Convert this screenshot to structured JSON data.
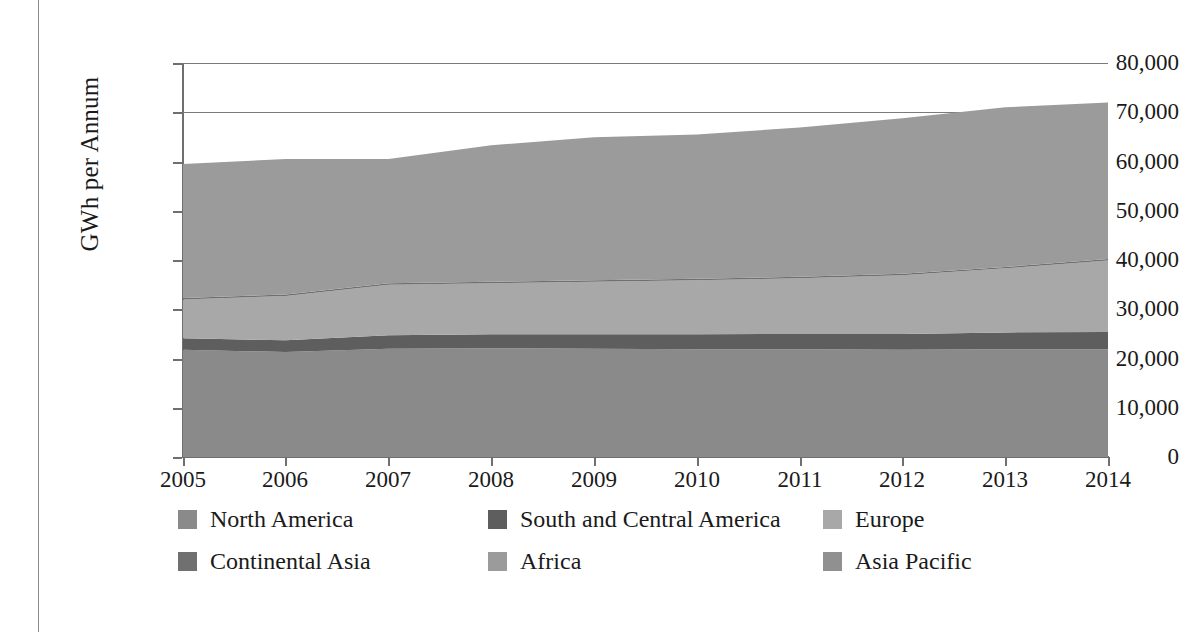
{
  "axes": {
    "y_title": "GWh per Annum",
    "y_ticks": [
      "80,000",
      "70,000",
      "60,000",
      "50,000",
      "40,000",
      "30,000",
      "20,000",
      "10,000",
      "0"
    ],
    "x_ticks": [
      "2005",
      "2006",
      "2007",
      "2008",
      "2009",
      "2010",
      "2011",
      "2012",
      "2013",
      "2014"
    ]
  },
  "legend": {
    "rows": [
      [
        {
          "label": "North America",
          "color": "#8a8a8a"
        },
        {
          "label": "South and Central America",
          "color": "#5e5e5e"
        },
        {
          "label": "Europe",
          "color": "#a8a8a8"
        }
      ],
      [
        {
          "label": "Continental Asia",
          "color": "#707070"
        },
        {
          "label": "Africa",
          "color": "#9b9b9b"
        },
        {
          "label": "Asia Pacific",
          "color": "#909090"
        }
      ]
    ]
  },
  "chart_data": {
    "type": "area",
    "title": "",
    "xlabel": "",
    "ylabel": "GWh per Annum",
    "x": [
      2005,
      2006,
      2007,
      2008,
      2009,
      2010,
      2011,
      2012,
      2013,
      2014
    ],
    "xlim": [
      2005,
      2014
    ],
    "ylim": [
      0,
      80000
    ],
    "ytick_step": 10000,
    "grid": "horizontal-major",
    "gridlines_visible": [
      80000,
      70000
    ],
    "legend_position": "bottom",
    "stacked": true,
    "series": [
      {
        "name": "North America",
        "color": "#8a8a8a",
        "values": [
          21800,
          21300,
          22000,
          22100,
          22000,
          21900,
          21900,
          21800,
          21900,
          21900
        ]
      },
      {
        "name": "South and Central America",
        "color": "#5e5e5e",
        "values": [
          2300,
          2400,
          2700,
          2800,
          2900,
          3000,
          3100,
          3200,
          3400,
          3500
        ]
      },
      {
        "name": "Europe",
        "color": "#a8a8a8",
        "values": [
          7900,
          9000,
          10300,
          10400,
          10700,
          11000,
          11300,
          11900,
          13000,
          14500
        ]
      },
      {
        "name": "Continental Asia",
        "color": "#707070",
        "values": [
          300,
          300,
          300,
          300,
          300,
          300,
          300,
          300,
          300,
          300
        ]
      },
      {
        "name": "Africa",
        "color": "#9b9b9b",
        "values": [
          27200,
          27500,
          25200,
          27700,
          29000,
          29300,
          30300,
          31600,
          32400,
          31800
        ]
      },
      {
        "name": "Asia Pacific",
        "color": "#909090",
        "values": [
          0,
          0,
          0,
          0,
          0,
          0,
          0,
          0,
          0,
          0
        ]
      }
    ],
    "cumulative_top": [
      59500,
      60500,
      60500,
      63300,
      64900,
      65500,
      66900,
      68800,
      71000,
      72000
    ],
    "annotations": []
  }
}
